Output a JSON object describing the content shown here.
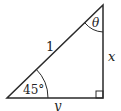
{
  "diagram": {
    "type": "right-triangle",
    "hypotenuse_label": "1",
    "vertical_side_label": "x",
    "horizontal_side_label": "y",
    "bottom_left_angle_label": "45°",
    "top_angle_label": "θ",
    "right_angle_marker": true,
    "stroke_color": "#2a2a2a"
  }
}
